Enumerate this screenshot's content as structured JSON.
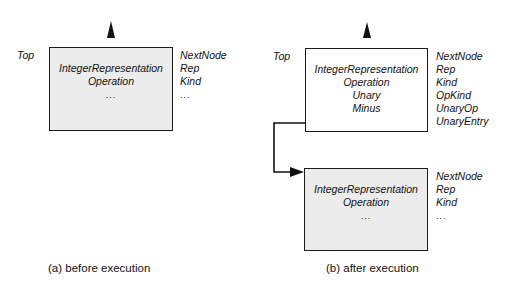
{
  "panels": {
    "a": {
      "caption": "(a) before execution",
      "top_label": "Top",
      "node": {
        "fields": [
          "IntegerRepresentation",
          "Operation",
          "..."
        ],
        "slots": [
          "NextNode",
          "Rep",
          "Kind",
          "..."
        ]
      }
    },
    "b": {
      "caption": "(b) after execution",
      "top_label": "Top",
      "new_node": {
        "fields": [
          "IntegerRepresentation",
          "Operation",
          "Unary",
          "Minus"
        ],
        "slots": [
          "NextNode",
          "Rep",
          "Kind",
          "OpKind",
          "UnaryOp",
          "UnaryEntry"
        ]
      },
      "old_node": {
        "fields": [
          "IntegerRepresentation",
          "Operation",
          "..."
        ],
        "slots": [
          "NextNode",
          "Rep",
          "Kind",
          "..."
        ]
      }
    }
  },
  "colors": {
    "shaded_fill": "#ececec",
    "line": "#1a1a1a"
  }
}
